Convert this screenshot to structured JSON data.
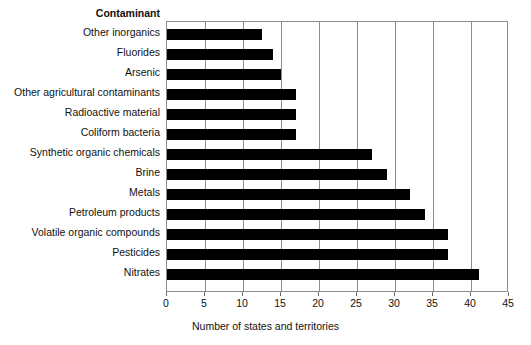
{
  "chart_data": {
    "type": "bar",
    "orientation": "horizontal",
    "title": "",
    "category_header": "Contaminant",
    "categories": [
      "Other inorganics",
      "Fluorides",
      "Arsenic",
      "Other agricultural contaminants",
      "Radioactive material",
      "Coliform bacteria",
      "Synthetic organic chemicals",
      "Brine",
      "Metals",
      "Petroleum products",
      "Volatile organic compounds",
      "Pesticides",
      "Nitrates"
    ],
    "values": [
      12.5,
      14,
      15,
      17,
      17,
      17,
      27,
      29,
      32,
      34,
      37,
      37,
      41
    ],
    "xlabel": "Number of states and territories",
    "ylabel": "Contaminant",
    "xlim": [
      0,
      45
    ],
    "xticks": [
      0,
      5,
      10,
      15,
      20,
      25,
      30,
      35,
      40,
      45
    ],
    "xtick_labels": [
      "0",
      "5",
      "10",
      "15",
      "20",
      "25",
      "30",
      "35",
      "40",
      "45"
    ],
    "grid": "vertical",
    "legend": "none",
    "bar_color": "#000000",
    "grid_color": "#8d8d8d",
    "background_color": "#ffffff"
  }
}
